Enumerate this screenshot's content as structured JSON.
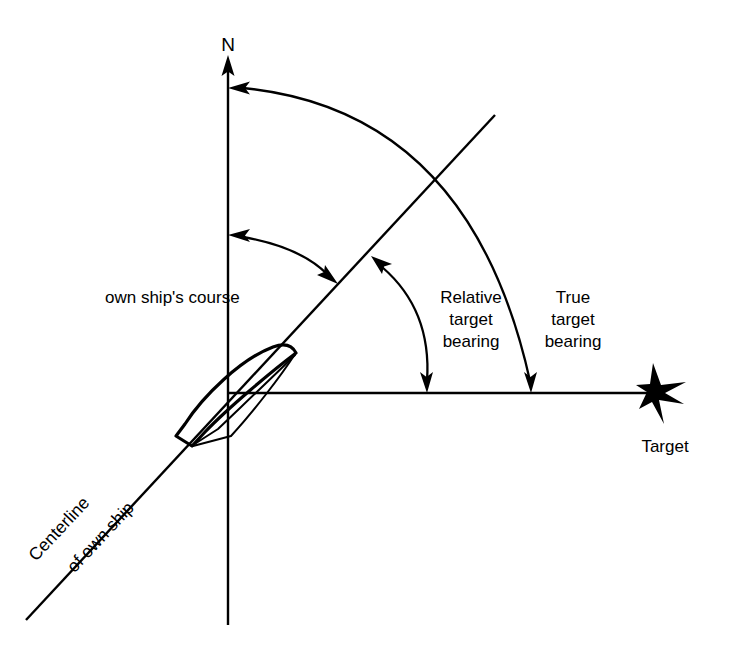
{
  "figure": {
    "background_color": "#ffffff",
    "line_color": "#000000"
  },
  "labels": {
    "north": "N",
    "own_ship_course": "own ship's course",
    "relative_bearing_line1": "Relative",
    "relative_bearing_line2": "target",
    "relative_bearing_line3": "bearing",
    "true_bearing_line1": "True",
    "true_bearing_line2": "target",
    "true_bearing_line3": "bearing",
    "centerline_line1": "Centerline",
    "centerline_line2": "of own ship",
    "target": "Target"
  },
  "icons": {
    "north_arrow": "north-arrow-icon",
    "ship": "ship-hull-icon",
    "target_marker": "target-burst-icon"
  },
  "geometry": {
    "origin_x": 228,
    "origin_y": 393,
    "north_axis_top_y": 57,
    "north_axis_bottom_y": 625,
    "horizontal_axis_end_x": 660,
    "centerline_start_x": 26,
    "centerline_start_y": 620,
    "centerline_end_x": 495,
    "centerline_end_y": 115,
    "centerline_angle_deg": 47,
    "true_bearing_arc_start_x": 232,
    "true_bearing_arc_start_y": 88,
    "true_bearing_arc_end_x": 530,
    "true_bearing_arc_end_y": 391,
    "relative_bearing_arc_start_x": 374,
    "relative_bearing_arc_start_y": 259,
    "relative_bearing_arc_end_x": 427,
    "relative_bearing_arc_end_y": 391,
    "course_arc_start_x": 232,
    "course_arc_start_y": 236,
    "course_arc_end_x": 334,
    "course_arc_end_y": 280
  }
}
